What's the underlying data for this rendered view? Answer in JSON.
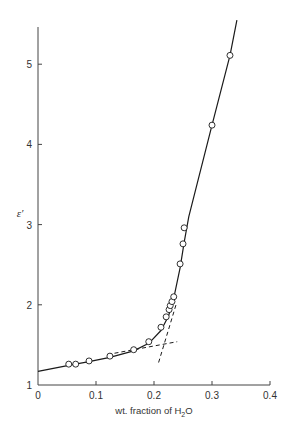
{
  "chart_data": {
    "type": "scatter",
    "title": "",
    "xlabel": "wt. fraction of H2O",
    "xlabel_parts": {
      "pre": "wt. fraction of H",
      "sub": "2",
      "post": "O"
    },
    "ylabel": "ε′",
    "xlim": [
      0,
      0.4
    ],
    "ylim": [
      1,
      5.5
    ],
    "x_ticks": [
      0,
      0.1,
      0.2,
      0.3,
      0.4
    ],
    "x_tick_labels": [
      "0",
      "0.1",
      "0.2",
      "0.3",
      "0.4"
    ],
    "y_ticks": [
      1,
      2,
      3,
      4,
      5
    ],
    "y_tick_labels": [
      "1",
      "2",
      "3",
      "4",
      "5"
    ],
    "grid": false,
    "legend": null,
    "series": [
      {
        "name": "measured",
        "marker": "open-circle",
        "points": [
          [
            0.053,
            1.26
          ],
          [
            0.065,
            1.26
          ],
          [
            0.088,
            1.3
          ],
          [
            0.124,
            1.36
          ],
          [
            0.165,
            1.44
          ],
          [
            0.191,
            1.54
          ],
          [
            0.212,
            1.72
          ],
          [
            0.221,
            1.85
          ],
          [
            0.226,
            1.94
          ],
          [
            0.228,
            1.99
          ],
          [
            0.231,
            2.04
          ],
          [
            0.234,
            2.1
          ],
          [
            0.245,
            2.51
          ],
          [
            0.25,
            2.76
          ],
          [
            0.252,
            2.96
          ],
          [
            0.3,
            4.24
          ],
          [
            0.331,
            5.11
          ]
        ]
      },
      {
        "name": "fit curve",
        "style": "solid",
        "points": [
          [
            0.0,
            1.17
          ],
          [
            0.053,
            1.245
          ],
          [
            0.088,
            1.29
          ],
          [
            0.124,
            1.345
          ],
          [
            0.165,
            1.425
          ],
          [
            0.191,
            1.52
          ],
          [
            0.212,
            1.68
          ],
          [
            0.225,
            1.86
          ],
          [
            0.234,
            2.08
          ],
          [
            0.245,
            2.46
          ],
          [
            0.252,
            2.78
          ],
          [
            0.26,
            3.1
          ],
          [
            0.3,
            4.24
          ],
          [
            0.331,
            5.11
          ],
          [
            0.343,
            5.55
          ]
        ]
      },
      {
        "name": "low-concentration extrapolation",
        "style": "dashed",
        "points": [
          [
            0.12,
            1.38
          ],
          [
            0.24,
            1.54
          ]
        ]
      },
      {
        "name": "high-concentration extrapolation",
        "style": "dashed",
        "points": [
          [
            0.208,
            1.28
          ],
          [
            0.238,
            2.0
          ]
        ]
      }
    ]
  },
  "plot_area": {
    "x0": 38,
    "y0": 385,
    "x_px_per_unit": 580,
    "y_px_per_unit": 80.2,
    "y_top_px": 27
  },
  "colors": {
    "line": "#1a1a1a",
    "axis": "#444444",
    "marker_fill": "#ffffff"
  }
}
